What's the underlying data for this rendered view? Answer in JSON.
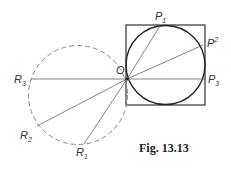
{
  "figure": {
    "caption": "Fig. 13.13",
    "labels": {
      "O": "O",
      "P1": "P",
      "P1_sub": "1",
      "P2": "P",
      "P2_sup": "2",
      "P3": "P",
      "P3_sub": "3",
      "R1": "R",
      "R1_sub": "1",
      "R2": "R",
      "R2_sub": "2",
      "R3": "R",
      "R3_sub": "3"
    }
  },
  "geometry": {
    "square": {
      "x": 126,
      "y": 25,
      "size": 79
    },
    "solid_circle": {
      "cx": 165.5,
      "cy": 65,
      "r": 39.5
    },
    "dashed_circle": {
      "cx": 78,
      "cy": 95,
      "r": 49.5
    },
    "origin": {
      "x": 127,
      "y": 79
    },
    "points": {
      "P1": [
        160,
        26
      ],
      "P2": [
        203,
        45
      ],
      "P3": [
        205,
        79
      ],
      "R1": [
        84,
        144
      ],
      "R2": [
        37,
        126
      ],
      "R3": [
        31,
        79
      ]
    }
  },
  "colors": {
    "line": "#333333",
    "thin": "#666666",
    "dashed": "#888888"
  }
}
